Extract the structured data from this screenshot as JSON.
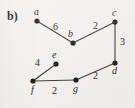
{
  "figure": {
    "panel_label": "b)",
    "background_color": "#f3f2ef",
    "ink_color": "#1b1814"
  },
  "chart_data": {
    "type": "diagram",
    "diagram_kind": "weighted-undirected-graph",
    "title": "b)",
    "nodes": [
      {
        "id": "a",
        "label": "a",
        "x": 37,
        "y": 21,
        "label_x": 34,
        "label_y": 7
      },
      {
        "id": "b",
        "label": "b",
        "x": 73,
        "y": 43,
        "label_x": 68,
        "label_y": 29
      },
      {
        "id": "c",
        "label": "c",
        "x": 115,
        "y": 22,
        "label_x": 112,
        "label_y": 8
      },
      {
        "id": "d",
        "label": "d",
        "x": 115,
        "y": 63,
        "label_x": 112,
        "label_y": 66
      },
      {
        "id": "e",
        "label": "e",
        "x": 56,
        "y": 64,
        "label_x": 52,
        "label_y": 50
      },
      {
        "id": "f",
        "label": "f",
        "x": 33,
        "y": 81,
        "label_x": 31,
        "label_y": 85
      },
      {
        "id": "g",
        "label": "g",
        "x": 76,
        "y": 80,
        "label_x": 73,
        "label_y": 84
      }
    ],
    "edges": [
      {
        "source": "a",
        "target": "b",
        "weight": "6",
        "label_x": 53,
        "label_y": 22
      },
      {
        "source": "b",
        "target": "c",
        "weight": "2",
        "label_x": 93,
        "label_y": 21
      },
      {
        "source": "c",
        "target": "d",
        "weight": "3",
        "label_x": 120,
        "label_y": 37
      },
      {
        "source": "d",
        "target": "g",
        "weight": "2",
        "label_x": 93,
        "label_y": 71
      },
      {
        "source": "g",
        "target": "f",
        "weight": "2",
        "label_x": 52,
        "label_y": 86
      },
      {
        "source": "f",
        "target": "e",
        "weight": "4",
        "label_x": 35,
        "label_y": 58
      }
    ]
  }
}
